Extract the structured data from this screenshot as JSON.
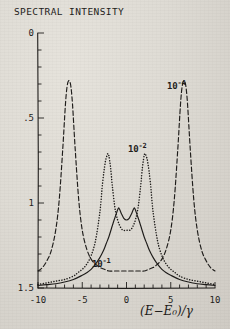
{
  "chart_data": {
    "type": "line",
    "title": "SPECTRAL INTENSITY",
    "xlabel": "(E−E₀)/γ",
    "ylabel": "",
    "xlim": [
      -10,
      10
    ],
    "ylim": [
      0,
      1.5
    ],
    "grid": false,
    "legend": "inline-annotations",
    "x_ticks": [
      -10,
      -5,
      0,
      5,
      10
    ],
    "x_tick_labels": [
      "-10",
      "-5",
      "0",
      "5",
      "10"
    ],
    "x_minor_tick_step": 1,
    "y_ticks": [
      0,
      0.5,
      1,
      1.5
    ],
    "y_tick_labels": [
      "0",
      ".5",
      "1",
      "1.5"
    ],
    "y_minor_tick_step": 0.1,
    "series": [
      {
        "name": "10⁻⁴",
        "label": "10",
        "exponent": "-4",
        "style": "dashed",
        "color": "#1d1b19",
        "peaks": [
          -6.5,
          6.5
        ],
        "peak_height": 1.22,
        "half_width": 1.1,
        "x": [
          -10,
          -9.5,
          -9,
          -8.5,
          -8,
          -7.6,
          -7.2,
          -6.9,
          -6.7,
          -6.5,
          -6.3,
          -6.1,
          -5.8,
          -5.4,
          -5,
          -4.5,
          -4,
          -3.5,
          -3,
          -2.5,
          -2,
          -1.5,
          -1,
          -0.5,
          0,
          0.5,
          1,
          1.5,
          2,
          2.5,
          3,
          3.5,
          4,
          4.5,
          5,
          5.4,
          5.8,
          6.1,
          6.3,
          6.5,
          6.7,
          6.9,
          7.2,
          7.6,
          8,
          8.5,
          9,
          9.5,
          10
        ],
        "y": [
          0.1,
          0.12,
          0.16,
          0.22,
          0.34,
          0.52,
          0.82,
          1.08,
          1.19,
          1.22,
          1.19,
          1.08,
          0.82,
          0.52,
          0.34,
          0.23,
          0.17,
          0.14,
          0.12,
          0.11,
          0.1,
          0.1,
          0.1,
          0.1,
          0.1,
          0.1,
          0.1,
          0.1,
          0.1,
          0.11,
          0.12,
          0.14,
          0.17,
          0.23,
          0.34,
          0.52,
          0.82,
          1.08,
          1.19,
          1.22,
          1.19,
          1.08,
          0.82,
          0.52,
          0.34,
          0.22,
          0.16,
          0.12,
          0.1
        ]
      },
      {
        "name": "10⁻²",
        "label": "10",
        "exponent": "-2",
        "style": "dotted",
        "color": "#1d1b19",
        "peaks": [
          -2.1,
          2.1
        ],
        "peak_height": 0.79,
        "half_width": 0.75,
        "x": [
          -10,
          -9,
          -8,
          -7,
          -6,
          -5.5,
          -5,
          -4.5,
          -4,
          -3.5,
          -3,
          -2.7,
          -2.4,
          -2.2,
          -2.1,
          -2.0,
          -1.8,
          -1.6,
          -1.3,
          -1.0,
          -0.7,
          -0.4,
          0,
          0.4,
          0.7,
          1.0,
          1.3,
          1.6,
          1.8,
          2.0,
          2.1,
          2.2,
          2.4,
          2.7,
          3,
          3.5,
          4,
          4.5,
          5,
          5.5,
          6,
          7,
          8,
          9,
          10
        ],
        "y": [
          0.02,
          0.03,
          0.04,
          0.05,
          0.07,
          0.09,
          0.11,
          0.14,
          0.19,
          0.28,
          0.45,
          0.62,
          0.74,
          0.78,
          0.79,
          0.78,
          0.71,
          0.6,
          0.47,
          0.4,
          0.36,
          0.34,
          0.34,
          0.34,
          0.36,
          0.4,
          0.47,
          0.6,
          0.71,
          0.78,
          0.79,
          0.78,
          0.74,
          0.62,
          0.45,
          0.28,
          0.19,
          0.14,
          0.11,
          0.09,
          0.07,
          0.05,
          0.04,
          0.03,
          0.02
        ]
      },
      {
        "name": "10⁻¹",
        "label": "10",
        "exponent": "-1",
        "style": "solid",
        "color": "#1d1b19",
        "peaks": [
          -0.85,
          0.85
        ],
        "peak_height": 0.47,
        "central_dip": 0.4,
        "half_width": 2.4,
        "x": [
          -10,
          -9,
          -8,
          -7,
          -6,
          -5,
          -4.5,
          -4,
          -3.5,
          -3,
          -2.6,
          -2.3,
          -2.0,
          -1.7,
          -1.4,
          -1.2,
          -1.0,
          -0.85,
          -0.6,
          -0.3,
          0,
          0.3,
          0.6,
          0.85,
          1.0,
          1.2,
          1.4,
          1.7,
          2.0,
          2.3,
          2.6,
          3,
          3.5,
          4,
          4.5,
          5,
          6,
          7,
          8,
          9,
          10
        ],
        "y": [
          0.015,
          0.02,
          0.025,
          0.035,
          0.05,
          0.075,
          0.09,
          0.11,
          0.14,
          0.18,
          0.22,
          0.26,
          0.3,
          0.35,
          0.4,
          0.43,
          0.46,
          0.47,
          0.44,
          0.41,
          0.4,
          0.41,
          0.44,
          0.47,
          0.46,
          0.43,
          0.4,
          0.35,
          0.3,
          0.26,
          0.22,
          0.18,
          0.14,
          0.11,
          0.09,
          0.075,
          0.05,
          0.035,
          0.025,
          0.02,
          0.015
        ]
      }
    ],
    "annotations": [
      {
        "name": "annotation-10e-4",
        "text": "10",
        "exponent": "-4",
        "x": 8.0,
        "y": 1.06
      },
      {
        "name": "annotation-10e-2",
        "text": "10",
        "exponent": "-2",
        "x": 3.7,
        "y": 0.73
      },
      {
        "name": "annotation-10e-1",
        "text": "10",
        "exponent": "-1",
        "x": 0.2,
        "y": 0.1
      }
    ]
  },
  "axes": {
    "title": "SPECTRAL INTENSITY",
    "x_label": "(E−E₀)/γ",
    "y_tick_labels": [
      "1.5",
      "1",
      ".5",
      "0"
    ],
    "x_tick_labels": [
      "-10",
      "-5",
      "0",
      "5",
      "10"
    ]
  },
  "annotations": {
    "e4_base": "10",
    "e4_exp": "-4",
    "e2_base": "10",
    "e2_exp": "-2",
    "e1_base": "10",
    "e1_exp": "-1"
  },
  "colors": {
    "ink": "#1d1b19",
    "paper": "#dedbd4"
  }
}
